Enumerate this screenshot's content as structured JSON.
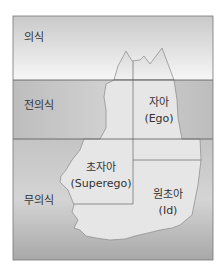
{
  "diagram": {
    "levels": [
      {
        "label": "의식"
      },
      {
        "label": "전의식"
      },
      {
        "label": "무의식"
      }
    ],
    "structures": [
      {
        "label": "자아",
        "sub": "(Ego)"
      },
      {
        "label": "초자아",
        "sub": "(Superego)"
      },
      {
        "label": "원초아",
        "sub": "(Id)"
      }
    ]
  }
}
